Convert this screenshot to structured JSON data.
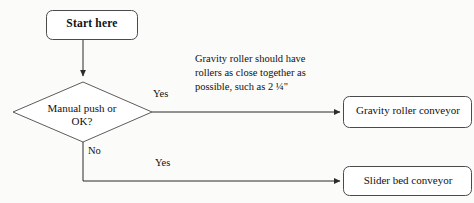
{
  "diagram": {
    "type": "flowchart",
    "background_color": "#fbfbfa",
    "line_color": "#333333",
    "text_color": "#111111",
    "nodes": [
      {
        "id": "start",
        "shape": "rounded-rectangle",
        "label": "Start here",
        "bold": true
      },
      {
        "id": "decision",
        "shape": "diamond",
        "label": "Manual push or\nOK?"
      },
      {
        "id": "gravity",
        "shape": "rounded-rectangle",
        "label": "Gravity roller conveyor"
      },
      {
        "id": "slider",
        "shape": "rounded-rectangle",
        "label": "Slider bed conveyor"
      }
    ],
    "edges": [
      {
        "id": "start-to-decision",
        "label": ""
      },
      {
        "id": "decision-to-gravity",
        "label": "Yes"
      },
      {
        "id": "decision-down",
        "label": "No"
      },
      {
        "id": "down-to-slider",
        "label": "Yes"
      }
    ],
    "annotations": [
      {
        "id": "gravity-note",
        "text": "Gravity roller should have rollers as close together as possible, such as 2 ¼\""
      }
    ]
  }
}
